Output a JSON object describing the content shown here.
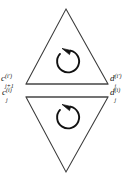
{
  "figure": {
    "background_color": "#ffffff",
    "stroke_color": "#2b2b2b",
    "arrow_color": "#1a1a1a",
    "upper_triangle": {
      "orientation": "up",
      "apex": [
        66,
        9
      ],
      "left_vertex": [
        26,
        84
      ],
      "right_vertex": [
        108,
        84
      ],
      "arrow": {
        "name": "counterclockwise-arrow",
        "direction": "counterclockwise",
        "center": [
          67,
          61
        ],
        "radius": 11
      }
    },
    "lower_triangle": {
      "orientation": "down",
      "apex": [
        66,
        172
      ],
      "left_vertex": [
        26,
        97
      ],
      "right_vertex": [
        108,
        97
      ],
      "arrow": {
        "name": "counterclockwise-arrow",
        "direction": "counterclockwise",
        "center": [
          67,
          117
        ],
        "radius": 11
      }
    },
    "labels": {
      "c_upper": {
        "base": "c",
        "superscript": "(i′)",
        "subscript": "j+1"
      },
      "c_lower": {
        "base": "c",
        "superscript": "(i)",
        "subscript": "j"
      },
      "d_upper": {
        "base": "d",
        "superscript": "(i′)",
        "subscript": "j"
      },
      "d_lower": {
        "base": "d",
        "superscript": "(i)",
        "subscript": "j"
      }
    }
  }
}
